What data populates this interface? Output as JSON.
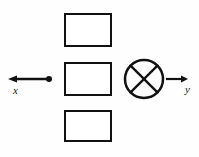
{
  "figure": {
    "background_color": "#fefefe",
    "stroke_color": "#111111",
    "boxes": [
      {
        "name": "top-box",
        "x": 64,
        "y": 13,
        "width": 48,
        "height": 34,
        "fill": "#ffffff"
      },
      {
        "name": "middle-box",
        "x": 64,
        "y": 62,
        "width": 48,
        "height": 34,
        "fill": "#ffffff"
      },
      {
        "name": "bottom-box",
        "x": 64,
        "y": 110,
        "width": 48,
        "height": 32,
        "fill": "#ffffff"
      }
    ],
    "x_axis": {
      "label": "x",
      "label_x": 13,
      "label_y": 85,
      "line_start_x": 14,
      "line_end_x": 49,
      "line_y": 79,
      "arrow_direction": "left",
      "terminator": "filled-dot",
      "dot_radius": 3
    },
    "y_axis": {
      "label": "y",
      "label_x": 185,
      "label_y": 84,
      "line_start_x": 166,
      "line_end_x": 188,
      "line_y": 79,
      "arrow_direction": "right",
      "terminator": "arrowhead"
    },
    "crossed_circle": {
      "name": "crossed-circle-symbol",
      "center_x": 144,
      "center_y": 79,
      "radius": 19,
      "stroke_width": 2.5,
      "cross": "X"
    }
  }
}
